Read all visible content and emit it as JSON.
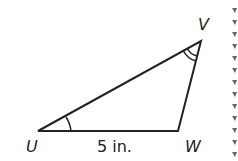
{
  "figure": {
    "vertices": {
      "U": {
        "label": "U",
        "x": 38,
        "y": 131
      },
      "W": {
        "label": "W",
        "x": 178,
        "y": 131
      },
      "V": {
        "label": "V",
        "x": 201,
        "y": 41
      }
    },
    "side_label": "5 in.",
    "angle_marks": {
      "U": "single arc",
      "V": "double arc"
    },
    "line_color": "#222222"
  }
}
